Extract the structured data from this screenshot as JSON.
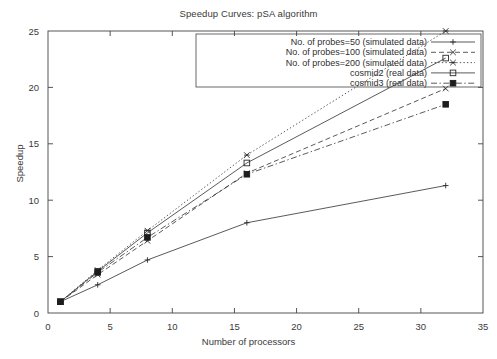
{
  "chart_data": {
    "type": "line",
    "title": "Speedup Curves: pSA algorithm",
    "xlabel": "Number of processors",
    "ylabel": "Speedup",
    "xlim": [
      0,
      35
    ],
    "ylim": [
      0,
      25
    ],
    "xticks": [
      0,
      5,
      10,
      15,
      20,
      25,
      30,
      35
    ],
    "yticks": [
      0,
      5,
      10,
      15,
      20,
      25
    ],
    "grid": false,
    "legend_position": "top-right",
    "x": [
      1,
      4,
      8,
      16,
      32
    ],
    "series": [
      {
        "name": "No. of probes=50 (simulated data)",
        "values": [
          1.0,
          2.5,
          4.7,
          8.0,
          11.3
        ],
        "linestyle": "solid",
        "marker": "plus"
      },
      {
        "name": "No. of probes=100 (simulated data)",
        "values": [
          1.0,
          3.4,
          6.4,
          12.4,
          19.9
        ],
        "linestyle": "dashed",
        "marker": "cross"
      },
      {
        "name": "No. of probes=200 (simulated data)",
        "values": [
          1.0,
          3.8,
          7.3,
          14.0,
          25.0
        ],
        "linestyle": "dotted",
        "marker": "star"
      },
      {
        "name": "cosmid2 (real data)",
        "values": [
          1.0,
          3.7,
          7.1,
          13.3,
          22.6
        ],
        "linestyle": "solid",
        "marker": "open-square"
      },
      {
        "name": "cosmid3 (real data)",
        "values": [
          1.0,
          3.6,
          6.7,
          12.3,
          18.5
        ],
        "linestyle": "dashdot",
        "marker": "filled-square"
      }
    ]
  },
  "colors": {
    "axis": "#444444",
    "ink": "#2b2b2b",
    "background": "#ffffff"
  }
}
